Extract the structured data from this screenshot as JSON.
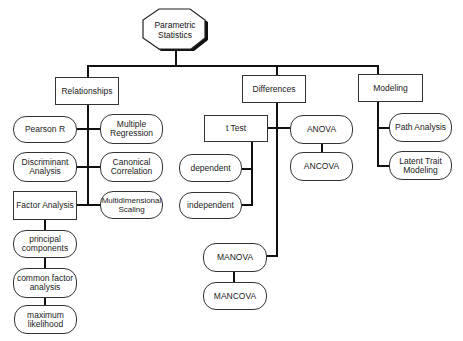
{
  "root": {
    "label_line1": "Parametric",
    "label_line2": "Statistics"
  },
  "categories": {
    "relationships": {
      "label": "Relationships",
      "items": {
        "pearson_r": "Pearson R",
        "multiple_regression_1": "Multiple",
        "multiple_regression_2": "Regression",
        "discriminant_1": "Discriminant",
        "discriminant_2": "Analysis",
        "canonical_1": "Canonical",
        "canonical_2": "Correlation",
        "factor_analysis": "Factor Analysis",
        "mds_1": "Multidimensional",
        "mds_2": "Scaling"
      },
      "factor_methods": {
        "principal_1": "principal",
        "principal_2": "components",
        "common_1": "common factor",
        "common_2": "analysis",
        "ml_1": "maximum",
        "ml_2": "likelihood"
      }
    },
    "differences": {
      "label": "Differences",
      "items": {
        "t_test": "t Test",
        "dependent": "dependent",
        "independent": "independent",
        "anova": "ANOVA",
        "ancova": "ANCOVA",
        "manova": "MANOVA",
        "mancova": "MANCOVA"
      }
    },
    "modeling": {
      "label": "Modeling",
      "items": {
        "path_analysis": "Path Analysis",
        "latent_1": "Latent Trait",
        "latent_2": "Modeling"
      }
    }
  }
}
